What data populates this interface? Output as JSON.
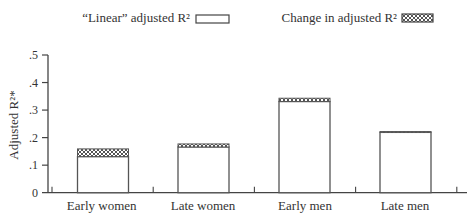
{
  "chart_data": {
    "type": "bar",
    "stacked": true,
    "title": "",
    "xlabel": "",
    "ylabel": "Adjusted R²*",
    "ylim": [
      0,
      0.5
    ],
    "yticks": [
      0,
      0.1,
      0.2,
      0.3,
      0.4,
      0.5
    ],
    "ytick_labels": [
      "0",
      ".1",
      ".2",
      ".3",
      ".4",
      ".5"
    ],
    "categories": [
      "Early women",
      "Late women",
      "Early men",
      "Late men"
    ],
    "series": [
      {
        "name": "“Linear” adjusted R²",
        "values": [
          0.131,
          0.166,
          0.331,
          0.219
        ],
        "fill": "#ffffff",
        "pattern": "none"
      },
      {
        "name": "Change in adjusted R²",
        "values": [
          0.028,
          0.011,
          0.012,
          0.003
        ],
        "fill": "#555555",
        "pattern": "crosshatch"
      }
    ],
    "totals": [
      0.159,
      0.177,
      0.343,
      0.222
    ],
    "legend_position": "top",
    "grid": false
  },
  "legend": {
    "linear_label": "“Linear” adjusted R²",
    "change_label": "Change in adjusted R²"
  },
  "colors": {
    "axis": "#444444",
    "bar_outline": "#555555",
    "hatch": "#555555",
    "text": "#333333"
  }
}
